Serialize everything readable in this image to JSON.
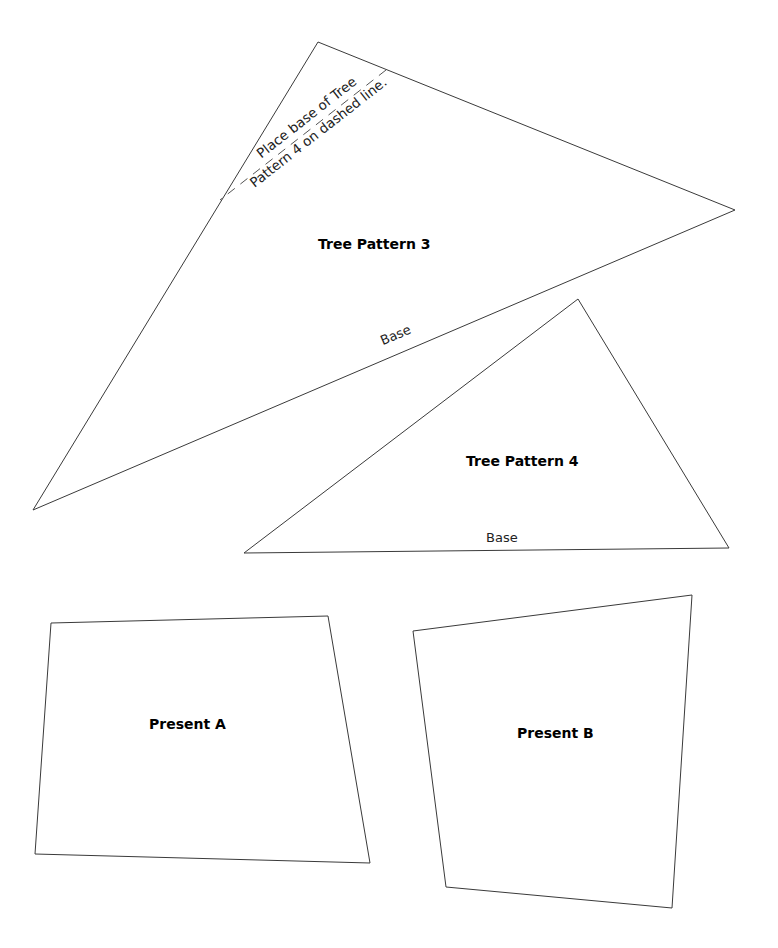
{
  "pieces": {
    "tree_pattern_3": {
      "title": "Tree Pattern 3",
      "base_label": "Base",
      "note_line1": "Place base of Tree",
      "note_line2": "Pattern 4 on dashed line."
    },
    "tree_pattern_4": {
      "title": "Tree Pattern 4",
      "base_label": "Base"
    },
    "present_a": {
      "title": "Present A"
    },
    "present_b": {
      "title": "Present B"
    }
  },
  "colors": {
    "outline": "#3a3a3a",
    "background": "#ffffff",
    "text": "#000000"
  }
}
